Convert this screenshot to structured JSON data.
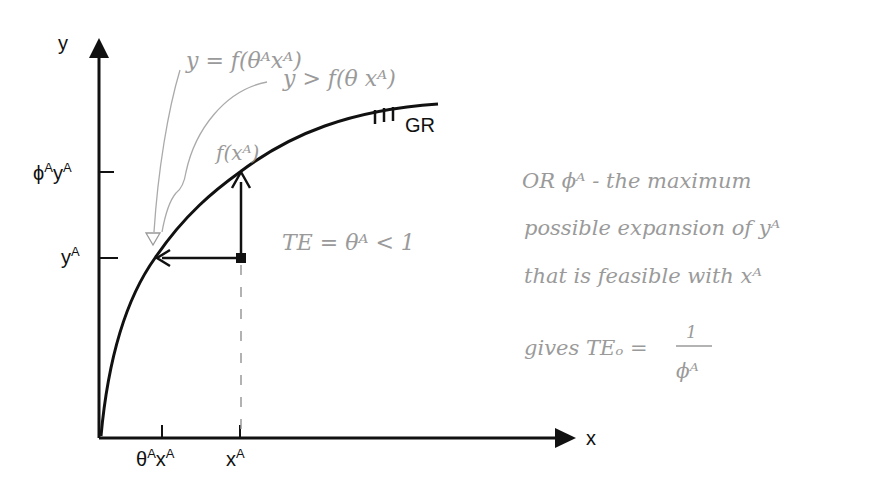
{
  "diagram": {
    "axes": {
      "y_label": "y",
      "x_label": "x"
    },
    "y_ticks": [
      {
        "base": "ϕ",
        "sup1": "A",
        "base2": "y",
        "sup2": "A",
        "name": "phi-A-y-A"
      },
      {
        "base": "y",
        "sup1": "A",
        "name": "y-A"
      }
    ],
    "x_ticks": [
      {
        "base": "θ",
        "sup1": "A",
        "base2": "x",
        "sup2": "A",
        "name": "theta-A-x-A"
      },
      {
        "base": "x",
        "sup1": "A",
        "name": "x-A"
      }
    ],
    "frontier_label": "GR",
    "curve_point_label": "f(xᴬ)",
    "annotations": {
      "eq_line": "y = f(θᴬxᴬ)",
      "gt_line": "y > f(θ xᴬ)",
      "te_input": "TE = θᴬ < 1"
    },
    "side_note": {
      "line1": "OR ϕᴬ - the maximum",
      "line2": "possible expansion of yᴬ",
      "line3": "that is feasible with xᴬ",
      "line4_prefix": "gives TEₒ =",
      "fraction_num": "1",
      "fraction_den": "ϕᴬ"
    },
    "colors": {
      "ink": "#111111",
      "pencil": "#9a9a9a",
      "background": "#ffffff"
    }
  }
}
